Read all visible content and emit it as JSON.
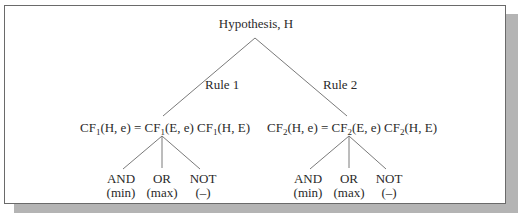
{
  "diagram": {
    "root": {
      "label": "Hypothesis, H"
    },
    "rules": [
      {
        "label": "Rule 1",
        "formula": {
          "lhs": "CF",
          "lhs_sub": "1",
          "lhs_args": "(H, e) = ",
          "a": "CF",
          "a_sub": "1",
          "a_args": "(E, e) ",
          "b": "CF",
          "b_sub": "1",
          "b_args": "(H, E)"
        },
        "operators": [
          {
            "name": "AND",
            "func": "(min)"
          },
          {
            "name": "OR",
            "func": "(max)"
          },
          {
            "name": "NOT",
            "func": "(–)"
          }
        ]
      },
      {
        "label": "Rule 2",
        "formula": {
          "lhs": "CF",
          "lhs_sub": "2",
          "lhs_args": "(H, e) = ",
          "a": "CF",
          "a_sub": "2",
          "a_args": "(E, e) ",
          "b": "CF",
          "b_sub": "2",
          "b_args": "(H, E)"
        },
        "operators": [
          {
            "name": "AND",
            "func": "(min)"
          },
          {
            "name": "OR",
            "func": "(max)"
          },
          {
            "name": "NOT",
            "func": "(–)"
          }
        ]
      }
    ]
  },
  "colors": {
    "line": "#7a7a7a",
    "frame": "#6a6a6a",
    "shadow": "#b4b4b4",
    "text": "#2a2a2a"
  }
}
